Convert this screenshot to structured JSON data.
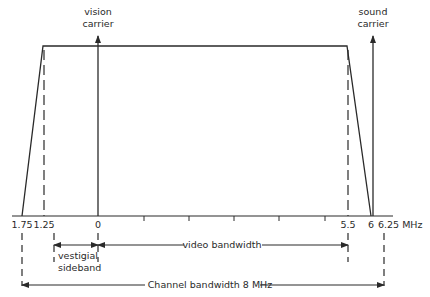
{
  "diagram": {
    "type": "tv-channel-spectrum",
    "carriers": {
      "vision": {
        "line1": "vision",
        "line2": "carrier",
        "freq": 0
      },
      "sound": {
        "line1": "sound",
        "line2": "carrier",
        "freq": 6
      }
    },
    "axis": {
      "unit": "MHz",
      "labels": [
        {
          "text": "1.75",
          "freq": -1.75
        },
        {
          "text": "1.25",
          "freq": -1.25
        },
        {
          "text": "0",
          "freq": 0
        },
        {
          "text": "5.5",
          "freq": 5.5
        },
        {
          "text": "6",
          "freq": 6
        },
        {
          "text": "6.25 MHz",
          "freq": 6.25
        }
      ],
      "unlabeled_ticks": [
        1,
        2,
        3,
        4,
        5
      ]
    },
    "annotations": {
      "vestigial_line1": "vestigial",
      "vestigial_line2": "sideband",
      "video_bandwidth": "video bandwidth",
      "channel_bandwidth": "Channel bandwidth 8 MHz"
    },
    "colors": {
      "line": "#2a2a2a",
      "background": "#ffffff"
    }
  }
}
